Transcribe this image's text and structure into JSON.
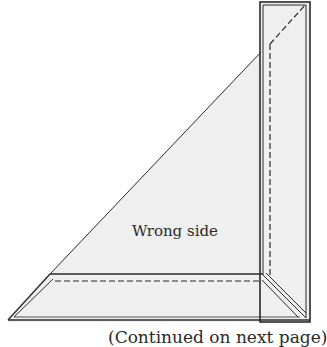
{
  "diagram": {
    "label": "Wrong side",
    "caption": "(Continued on next page)",
    "colors": {
      "fabric_fill": "#efefef",
      "outline": "#2a2a2a",
      "background": "#ffffff"
    }
  }
}
